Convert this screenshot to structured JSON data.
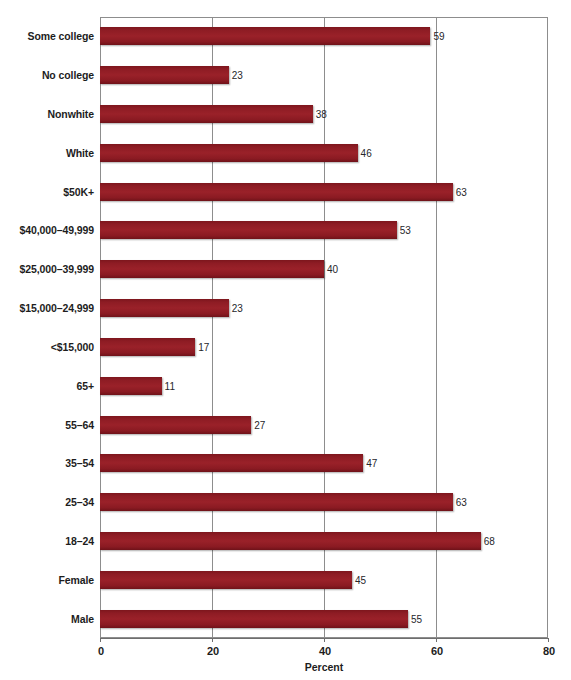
{
  "chart": {
    "axis_title": "Percent",
    "value_suffix": ""
  },
  "chart_data": {
    "type": "bar",
    "orientation": "horizontal",
    "title": "",
    "subtitle": "",
    "xlabel": "Percent",
    "ylabel": "",
    "xlim": [
      0,
      80
    ],
    "xticks": [
      0,
      20,
      40,
      60,
      80
    ],
    "xtick_labels": [
      "0",
      "20",
      "40",
      "60",
      "80"
    ],
    "grid": true,
    "grid_axis": "x",
    "legend": false,
    "legend_position": "none",
    "bar_color": "#8e1c24",
    "categories": [
      "Some college",
      "No college",
      "Nonwhite",
      "White",
      "$50K+",
      "$40,000–49,999",
      "$25,000–39,999",
      "$15,000–24,999",
      "<$15,000",
      "65+",
      "55–64",
      "35–54",
      "25–34",
      "18–24",
      "Female",
      "Male"
    ],
    "values": [
      59,
      23,
      38,
      46,
      63,
      53,
      40,
      23,
      17,
      11,
      27,
      47,
      63,
      68,
      45,
      55
    ],
    "bars": [
      {
        "label": "Some college",
        "value": 59,
        "value_label": "59"
      },
      {
        "label": "No college",
        "value": 23,
        "value_label": "23"
      },
      {
        "label": "Nonwhite",
        "value": 38,
        "value_label": "38"
      },
      {
        "label": "White",
        "value": 46,
        "value_label": "46"
      },
      {
        "label": "$50K+",
        "value": 63,
        "value_label": "63"
      },
      {
        "label": "$40,000–49,999",
        "value": 53,
        "value_label": "53"
      },
      {
        "label": "$25,000–39,999",
        "value": 40,
        "value_label": "40"
      },
      {
        "label": "$15,000–24,999",
        "value": 23,
        "value_label": "23"
      },
      {
        "label": "<$15,000",
        "value": 17,
        "value_label": "17"
      },
      {
        "label": "65+",
        "value": 11,
        "value_label": "11"
      },
      {
        "label": "55–64",
        "value": 27,
        "value_label": "27"
      },
      {
        "label": "35–54",
        "value": 47,
        "value_label": "47"
      },
      {
        "label": "25–34",
        "value": 63,
        "value_label": "63"
      },
      {
        "label": "18–24",
        "value": 68,
        "value_label": "68"
      },
      {
        "label": "Female",
        "value": 45,
        "value_label": "45"
      },
      {
        "label": "Male",
        "value": 55,
        "value_label": "55"
      }
    ]
  }
}
